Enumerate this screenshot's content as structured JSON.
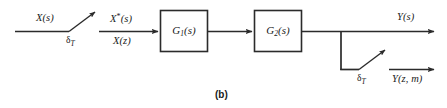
{
  "figure": {
    "caption": "(b)",
    "stroke_color": "#2b2b2b",
    "text_color": "#1a1a1a",
    "background": "#ffffff"
  },
  "signals": {
    "input_s": "X(s)",
    "sampled_star": "X*(s)",
    "sampled_z": "X(z)",
    "output_s": "Y(s)",
    "output_zm": "Y(z, m)"
  },
  "samplers": [
    {
      "name": "input-sampler",
      "label_delta": "δ",
      "label_sub": "T"
    },
    {
      "name": "output-sampler",
      "label_delta": "δ",
      "label_sub": "T"
    }
  ],
  "blocks": [
    {
      "name": "g1-block",
      "label_main": "G",
      "label_sub": "1",
      "label_arg": "(s)"
    },
    {
      "name": "g2-block",
      "label_main": "G",
      "label_sub": "2",
      "label_arg": "(s)"
    }
  ]
}
